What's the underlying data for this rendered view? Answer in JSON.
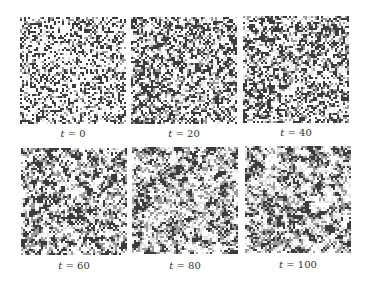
{
  "figure": {
    "panels": [
      {
        "time": 0,
        "label": "t = 0",
        "variable": "t",
        "value": "0"
      },
      {
        "time": 20,
        "label": "t = 20",
        "variable": "t",
        "value": "20"
      },
      {
        "time": 40,
        "label": "t = 40",
        "variable": "t",
        "value": "40"
      },
      {
        "time": 60,
        "label": "t = 60",
        "variable": "t",
        "value": "60"
      },
      {
        "time": 80,
        "label": "t = 80",
        "variable": "t",
        "value": "80"
      },
      {
        "time": 100,
        "label": "t = 100",
        "variable": "t",
        "value": "100"
      }
    ],
    "colors": {
      "dark": "#3c3c3c",
      "mid": "#9c9c9c",
      "light": "#e4e4e4",
      "background": "#ffffff"
    }
  }
}
